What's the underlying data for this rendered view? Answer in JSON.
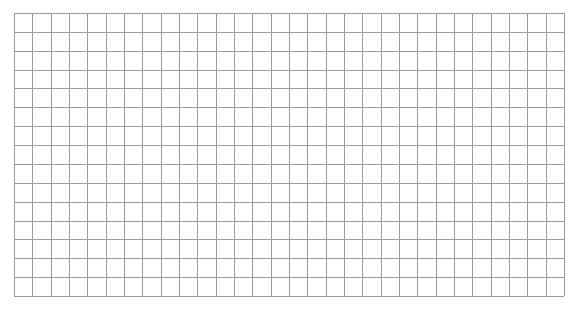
{
  "grid": {
    "columns": 30,
    "rows": 15,
    "line_color": "#9a9a9a",
    "background": "#ffffff"
  }
}
